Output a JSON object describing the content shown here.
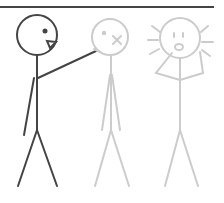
{
  "panel": {
    "description": "Stick figure comic panel: a dark figure pokes a grey figure in the face; a third grey figure reacts in shock",
    "colors": {
      "border": "#444444",
      "active_figure": "#444444",
      "faded_figure": "#cccccc",
      "background": "#ffffff"
    },
    "figures": [
      {
        "id": "pointer",
        "expression": "open-mouth",
        "action": "pointing"
      },
      {
        "id": "poked",
        "expression": "x-eye",
        "action": "standing"
      },
      {
        "id": "shocked",
        "expression": "gasp",
        "action": "hands-to-face"
      }
    ]
  }
}
